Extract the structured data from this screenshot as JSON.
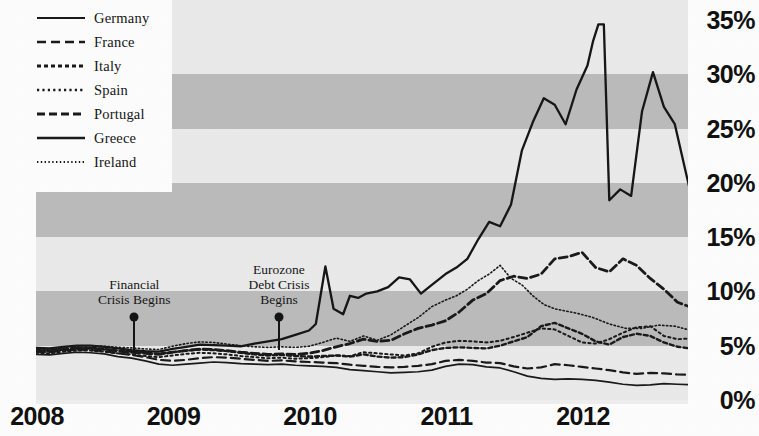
{
  "chart_data": {
    "type": "line",
    "title": "",
    "subtitle": "",
    "xlabel": "",
    "ylabel": "",
    "xlim": [
      2008.0,
      2012.83
    ],
    "ylim": [
      0,
      35
    ],
    "y_unit": "%",
    "grid": "horizontal alternating shaded bands every 5%",
    "legend_position": "top-left",
    "x_tick_labels": [
      "2008",
      "2009",
      "2010",
      "2011",
      "2012"
    ],
    "x_tick_values": [
      2008,
      2009,
      2010,
      2011,
      2012
    ],
    "y_tick_labels": [
      "0%",
      "5%",
      "10%",
      "15%",
      "20%",
      "25%",
      "30%",
      "35%"
    ],
    "y_tick_values": [
      0,
      5,
      10,
      15,
      20,
      25,
      30,
      35
    ],
    "annotations": [
      {
        "label": "Financial\nCrisis Begins",
        "lines": [
          "Financial",
          "Crisis Begins"
        ],
        "x": 2008.72,
        "y": 7.6
      },
      {
        "label": "Eurozone\nDebt Crisis\nBegins",
        "lines": [
          "Eurozone",
          "Debt Crisis",
          "Begins"
        ],
        "x": 2009.78,
        "y": 7.6
      }
    ],
    "series": [
      {
        "name": "Germany",
        "style": "solid",
        "color": "#1a1a1a",
        "x": [
          2008.0,
          2008.1,
          2008.2,
          2008.3,
          2008.4,
          2008.5,
          2008.6,
          2008.7,
          2008.8,
          2008.9,
          2009.0,
          2009.1,
          2009.2,
          2009.3,
          2009.4,
          2009.5,
          2009.6,
          2009.7,
          2009.8,
          2009.9,
          2010.0,
          2010.1,
          2010.2,
          2010.3,
          2010.4,
          2010.5,
          2010.6,
          2010.7,
          2010.8,
          2010.9,
          2011.0,
          2011.1,
          2011.2,
          2011.3,
          2011.4,
          2011.5,
          2011.6,
          2011.7,
          2011.8,
          2011.9,
          2012.0,
          2012.1,
          2012.2,
          2012.3,
          2012.4,
          2012.5,
          2012.6,
          2012.7,
          2012.83
        ],
        "y": [
          4.2,
          4.15,
          4.3,
          4.4,
          4.35,
          4.25,
          4.0,
          3.85,
          3.6,
          3.3,
          3.2,
          3.3,
          3.4,
          3.5,
          3.45,
          3.35,
          3.3,
          3.25,
          3.3,
          3.2,
          3.15,
          3.1,
          3.0,
          2.8,
          2.7,
          2.6,
          2.5,
          2.55,
          2.6,
          2.75,
          3.1,
          3.3,
          3.25,
          3.05,
          2.95,
          2.6,
          2.2,
          2.0,
          1.9,
          1.95,
          1.9,
          1.8,
          1.65,
          1.45,
          1.35,
          1.4,
          1.5,
          1.45,
          1.4
        ]
      },
      {
        "name": "France",
        "style": "dashed",
        "color": "#1a1a1a",
        "x": [
          2008.0,
          2008.1,
          2008.2,
          2008.3,
          2008.4,
          2008.5,
          2008.6,
          2008.7,
          2008.8,
          2008.9,
          2009.0,
          2009.1,
          2009.2,
          2009.3,
          2009.4,
          2009.5,
          2009.6,
          2009.7,
          2009.8,
          2009.9,
          2010.0,
          2010.1,
          2010.2,
          2010.3,
          2010.4,
          2010.5,
          2010.6,
          2010.7,
          2010.8,
          2010.9,
          2011.0,
          2011.1,
          2011.2,
          2011.3,
          2011.4,
          2011.5,
          2011.6,
          2011.7,
          2011.8,
          2011.9,
          2012.0,
          2012.1,
          2012.2,
          2012.3,
          2012.4,
          2012.5,
          2012.6,
          2012.7,
          2012.83
        ],
        "y": [
          4.45,
          4.4,
          4.55,
          4.65,
          4.6,
          4.5,
          4.3,
          4.15,
          3.95,
          3.7,
          3.6,
          3.7,
          3.85,
          3.95,
          3.9,
          3.8,
          3.7,
          3.6,
          3.65,
          3.55,
          3.5,
          3.45,
          3.4,
          3.25,
          3.15,
          3.05,
          3.0,
          3.05,
          3.15,
          3.3,
          3.6,
          3.7,
          3.6,
          3.45,
          3.4,
          3.1,
          2.9,
          3.0,
          3.3,
          3.2,
          3.05,
          2.9,
          2.75,
          2.55,
          2.4,
          2.5,
          2.45,
          2.35,
          2.3
        ]
      },
      {
        "name": "Italy",
        "style": "dotted-dash",
        "color": "#1a1a1a",
        "x": [
          2008.0,
          2008.1,
          2008.2,
          2008.3,
          2008.4,
          2008.5,
          2008.6,
          2008.7,
          2008.8,
          2008.9,
          2009.0,
          2009.1,
          2009.2,
          2009.3,
          2009.4,
          2009.5,
          2009.6,
          2009.7,
          2009.8,
          2009.9,
          2010.0,
          2010.1,
          2010.2,
          2010.3,
          2010.4,
          2010.5,
          2010.6,
          2010.7,
          2010.8,
          2010.9,
          2011.0,
          2011.1,
          2011.2,
          2011.3,
          2011.4,
          2011.5,
          2011.6,
          2011.7,
          2011.8,
          2011.9,
          2012.0,
          2012.1,
          2012.2,
          2012.3,
          2012.4,
          2012.5,
          2012.6,
          2012.7,
          2012.83
        ],
        "y": [
          4.6,
          4.55,
          4.7,
          4.8,
          4.8,
          4.7,
          4.55,
          4.45,
          4.35,
          4.25,
          4.4,
          4.55,
          4.65,
          4.6,
          4.5,
          4.35,
          4.2,
          4.1,
          4.15,
          4.05,
          4.0,
          4.05,
          4.1,
          4.0,
          4.2,
          4.0,
          3.9,
          3.95,
          4.2,
          4.6,
          4.8,
          4.85,
          4.8,
          4.75,
          5.0,
          5.4,
          5.8,
          6.8,
          7.1,
          6.6,
          6.1,
          5.4,
          5.1,
          5.8,
          6.1,
          5.9,
          5.3,
          4.9,
          4.7
        ]
      },
      {
        "name": "Spain",
        "style": "fine-dotted",
        "color": "#1a1a1a",
        "x": [
          2008.0,
          2008.1,
          2008.2,
          2008.3,
          2008.4,
          2008.5,
          2008.6,
          2008.7,
          2008.8,
          2008.9,
          2009.0,
          2009.1,
          2009.2,
          2009.3,
          2009.4,
          2009.5,
          2009.6,
          2009.7,
          2009.8,
          2009.9,
          2010.0,
          2010.1,
          2010.2,
          2010.3,
          2010.4,
          2010.5,
          2010.6,
          2010.7,
          2010.8,
          2010.9,
          2011.0,
          2011.1,
          2011.2,
          2011.3,
          2011.4,
          2011.5,
          2011.6,
          2011.7,
          2011.8,
          2011.9,
          2012.0,
          2012.1,
          2012.2,
          2012.3,
          2012.4,
          2012.5,
          2012.6,
          2012.7,
          2012.83
        ],
        "y": [
          4.35,
          4.3,
          4.45,
          4.55,
          4.55,
          4.45,
          4.3,
          4.2,
          4.05,
          3.95,
          4.1,
          4.25,
          4.35,
          4.3,
          4.2,
          4.05,
          3.95,
          3.85,
          3.9,
          3.8,
          3.85,
          3.95,
          4.1,
          4.05,
          4.4,
          4.3,
          4.2,
          4.1,
          4.3,
          4.9,
          5.3,
          5.45,
          5.4,
          5.3,
          5.45,
          5.8,
          6.2,
          6.6,
          6.5,
          5.9,
          5.3,
          5.2,
          5.6,
          6.2,
          6.7,
          6.8,
          5.9,
          5.6,
          5.7
        ]
      },
      {
        "name": "Portugal",
        "style": "dash-heavy",
        "color": "#1a1a1a",
        "x": [
          2008.0,
          2008.1,
          2008.2,
          2008.3,
          2008.4,
          2008.5,
          2008.6,
          2008.7,
          2008.8,
          2008.9,
          2009.0,
          2009.1,
          2009.2,
          2009.3,
          2009.4,
          2009.5,
          2009.6,
          2009.7,
          2009.8,
          2009.9,
          2010.0,
          2010.1,
          2010.2,
          2010.3,
          2010.4,
          2010.5,
          2010.6,
          2010.7,
          2010.8,
          2010.9,
          2011.0,
          2011.1,
          2011.2,
          2011.3,
          2011.4,
          2011.5,
          2011.6,
          2011.7,
          2011.8,
          2011.9,
          2012.0,
          2012.1,
          2012.2,
          2012.3,
          2012.4,
          2012.5,
          2012.6,
          2012.7,
          2012.83
        ],
        "y": [
          4.55,
          4.5,
          4.65,
          4.75,
          4.75,
          4.65,
          4.5,
          4.4,
          4.3,
          4.2,
          4.4,
          4.55,
          4.7,
          4.65,
          4.55,
          4.4,
          4.3,
          4.2,
          4.25,
          4.2,
          4.3,
          4.55,
          4.9,
          5.2,
          5.6,
          5.4,
          5.5,
          6.1,
          6.6,
          6.9,
          7.3,
          8.1,
          9.2,
          9.8,
          11.0,
          11.4,
          11.2,
          11.6,
          13.0,
          13.2,
          13.6,
          12.2,
          11.8,
          13.0,
          12.4,
          11.2,
          10.2,
          9.0,
          8.4
        ]
      },
      {
        "name": "Greece",
        "style": "solid-heavy",
        "color": "#161616",
        "x": [
          2008.0,
          2008.1,
          2008.2,
          2008.3,
          2008.4,
          2008.5,
          2008.6,
          2008.7,
          2008.8,
          2008.9,
          2009.0,
          2009.1,
          2009.2,
          2009.3,
          2009.4,
          2009.5,
          2009.6,
          2009.7,
          2009.8,
          2009.9,
          2010.0,
          2010.05,
          2010.12,
          2010.18,
          2010.25,
          2010.3,
          2010.36,
          2010.42,
          2010.5,
          2010.58,
          2010.66,
          2010.74,
          2010.82,
          2010.9,
          2011.0,
          2011.08,
          2011.16,
          2011.24,
          2011.32,
          2011.4,
          2011.48,
          2011.56,
          2011.64,
          2011.72,
          2011.8,
          2011.88,
          2011.96,
          2012.04,
          2012.08,
          2012.12,
          2012.16,
          2012.2,
          2012.28,
          2012.36,
          2012.44,
          2012.52,
          2012.6,
          2012.68,
          2012.76,
          2012.83
        ],
        "y": [
          4.8,
          4.75,
          4.9,
          5.0,
          5.0,
          4.9,
          4.75,
          4.6,
          4.5,
          4.45,
          4.7,
          4.9,
          5.1,
          5.05,
          5.0,
          4.95,
          5.2,
          5.4,
          5.6,
          6.0,
          6.4,
          7.0,
          12.3,
          8.4,
          7.9,
          9.6,
          9.4,
          9.8,
          10.0,
          10.4,
          11.3,
          11.1,
          9.8,
          10.6,
          11.6,
          12.2,
          13.0,
          14.8,
          16.4,
          16.0,
          18.0,
          23.0,
          25.6,
          27.8,
          27.2,
          25.4,
          28.6,
          30.8,
          33.0,
          34.6,
          34.6,
          18.4,
          19.4,
          18.8,
          26.6,
          30.2,
          27.0,
          25.4,
          21.0,
          17.2
        ]
      },
      {
        "name": "Ireland",
        "style": "micro-dotted",
        "color": "#1a1a1a",
        "x": [
          2008.0,
          2008.1,
          2008.2,
          2008.3,
          2008.4,
          2008.5,
          2008.6,
          2008.7,
          2008.8,
          2008.9,
          2009.0,
          2009.1,
          2009.2,
          2009.3,
          2009.4,
          2009.5,
          2009.6,
          2009.7,
          2009.8,
          2009.9,
          2010.0,
          2010.1,
          2010.2,
          2010.3,
          2010.4,
          2010.5,
          2010.6,
          2010.7,
          2010.8,
          2010.9,
          2011.0,
          2011.08,
          2011.16,
          2011.24,
          2011.32,
          2011.4,
          2011.48,
          2011.56,
          2011.64,
          2011.72,
          2011.8,
          2011.88,
          2011.96,
          2012.08,
          2012.2,
          2012.32,
          2012.44,
          2012.56,
          2012.68,
          2012.83
        ],
        "y": [
          4.7,
          4.65,
          4.85,
          4.95,
          5.0,
          4.95,
          4.85,
          4.8,
          4.7,
          4.65,
          4.95,
          5.2,
          5.35,
          5.3,
          5.15,
          5.0,
          4.9,
          4.85,
          4.9,
          4.85,
          4.95,
          5.3,
          5.7,
          5.4,
          5.9,
          5.5,
          6.0,
          6.8,
          7.6,
          8.6,
          9.2,
          9.6,
          10.2,
          11.0,
          11.6,
          12.4,
          11.2,
          10.6,
          9.6,
          8.8,
          8.4,
          8.2,
          8.0,
          7.6,
          7.0,
          6.6,
          6.6,
          6.9,
          6.8,
          6.3
        ]
      }
    ]
  },
  "legend": {
    "items": [
      {
        "label": "Germany",
        "style": "solid"
      },
      {
        "label": "France",
        "style": "dashed"
      },
      {
        "label": "Italy",
        "style": "dotted-dash"
      },
      {
        "label": "Spain",
        "style": "fine-dotted"
      },
      {
        "label": "Portugal",
        "style": "dash-heavy"
      },
      {
        "label": "Greece",
        "style": "solid-heavy"
      },
      {
        "label": "Ireland",
        "style": "micro-dotted"
      }
    ]
  },
  "axes": {
    "y_labels": [
      "35%",
      "30%",
      "25%",
      "20%",
      "15%",
      "10%",
      "5%",
      "0%"
    ],
    "x_labels": [
      "2008",
      "2009",
      "2010",
      "2011",
      "2012"
    ]
  },
  "annotations": [
    {
      "id": "financial-crisis",
      "lines": [
        "Financial",
        "Crisis Begins"
      ]
    },
    {
      "id": "eurozone-crisis",
      "lines": [
        "Eurozone",
        "Debt Crisis",
        "Begins"
      ]
    }
  ],
  "colors": {
    "band_dark": "#bdbdbd",
    "band_light": "#ececec",
    "line": "#1a1a1a",
    "text": "#111111",
    "background": "#ffffff"
  }
}
